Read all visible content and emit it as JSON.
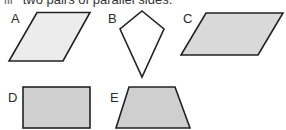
{
  "header": {
    "number": "iii",
    "text": "two pairs of parallel sides."
  },
  "shapes": [
    {
      "label": "A",
      "type": "parallelogram",
      "fill": "#ececec"
    },
    {
      "label": "B",
      "type": "kite",
      "fill": "#ffffff"
    },
    {
      "label": "C",
      "type": "parallelogram",
      "fill": "#d9d9d9"
    },
    {
      "label": "D",
      "type": "rectangle",
      "fill": "#d0d0d0"
    },
    {
      "label": "E",
      "type": "trapezium",
      "fill": "#cfcfcf"
    }
  ],
  "colors": {
    "stroke": "#222222"
  }
}
